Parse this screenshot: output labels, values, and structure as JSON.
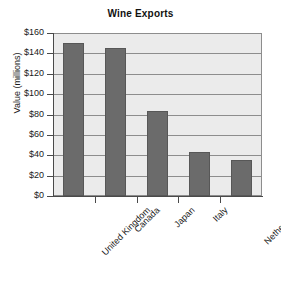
{
  "chart_data": {
    "type": "bar",
    "title": "Wine Exports",
    "xlabel": "",
    "ylabel": "Value (millions)",
    "categories": [
      "United Kingdom",
      "Canada",
      "Japan",
      "Italy",
      "Netherlands"
    ],
    "values": [
      150,
      145,
      83,
      43,
      35
    ],
    "ylim": [
      0,
      160
    ],
    "ytick_labels": [
      "$160",
      "$140",
      "$120",
      "$100",
      "$80",
      "$60",
      "$40",
      "$20",
      "$0"
    ],
    "ytick_values": [
      160,
      140,
      120,
      100,
      80,
      60,
      40,
      20,
      0
    ],
    "grid": true,
    "legend": "none",
    "colors": {
      "bar_fill": "#6b6b6b",
      "bar_edge": "#575757",
      "plot_background": "#ebebeb",
      "grid_line": "#8d8d8d",
      "axis": "#4a4a4a",
      "text": "#1a1a1a",
      "page_background": "#ffffff"
    }
  }
}
